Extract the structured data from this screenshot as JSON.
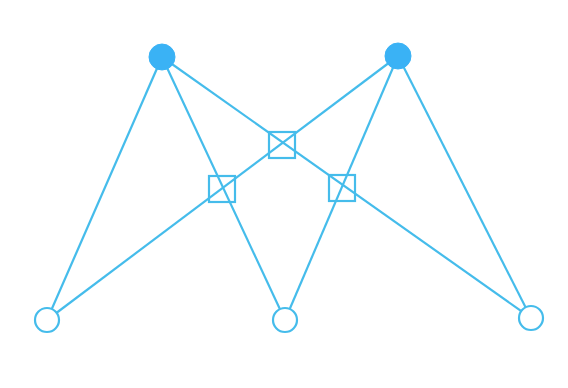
{
  "diagram": {
    "type": "bipartite-factor-graph",
    "stroke_color": "#45BCEB",
    "fill_color": "#3AB2F5",
    "background": "#FFFFFF",
    "top_nodes": [
      {
        "id": "t1",
        "x": 162,
        "y": 57,
        "r": 13,
        "filled": true
      },
      {
        "id": "t2",
        "x": 398,
        "y": 56,
        "r": 13,
        "filled": true
      }
    ],
    "bottom_nodes": [
      {
        "id": "b1",
        "x": 47,
        "y": 320,
        "r": 12,
        "filled": false
      },
      {
        "id": "b2",
        "x": 285,
        "y": 320,
        "r": 12,
        "filled": false
      },
      {
        "id": "b3",
        "x": 531,
        "y": 318,
        "r": 12,
        "filled": false
      }
    ],
    "factor_squares": [
      {
        "id": "f1",
        "x": 282,
        "y": 145,
        "size": 26
      },
      {
        "id": "f2",
        "x": 222,
        "y": 189,
        "size": 26
      },
      {
        "id": "f3",
        "x": 342,
        "y": 188,
        "size": 26
      }
    ],
    "edges": [
      {
        "from": "t1",
        "to": "b1"
      },
      {
        "from": "t1",
        "to": "b2"
      },
      {
        "from": "t1",
        "to": "b3"
      },
      {
        "from": "t2",
        "to": "b1"
      },
      {
        "from": "t2",
        "to": "b2"
      },
      {
        "from": "t2",
        "to": "b3"
      }
    ]
  }
}
